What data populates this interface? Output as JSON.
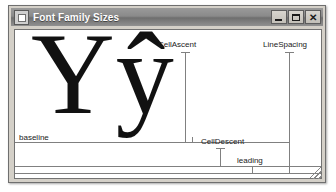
{
  "window": {
    "title": "Font Family Sizes",
    "icon": "app-icon",
    "controls": {
      "minimize_label": "",
      "maximize_label": "",
      "close_label": "✕"
    }
  },
  "diagram": {
    "sample_text": "Ŷŷ",
    "labels": {
      "cell_ascent": "CellAscent",
      "line_spacing": "LineSpacing",
      "baseline": "baseline",
      "cell_descent": "CellDescent",
      "leading": "leading"
    },
    "colors": {
      "guide_line": "#808080",
      "glyph": "#111111",
      "canvas": "#ffffff",
      "titlebar_text": "#ffffff"
    }
  }
}
